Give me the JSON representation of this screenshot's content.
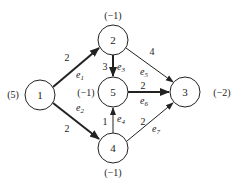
{
  "nodes": [
    {
      "id": "1",
      "label": "1",
      "supply": "(5)",
      "x": 40,
      "y": 95
    },
    {
      "id": "2",
      "label": "2",
      "supply": "(−1)",
      "x": 113,
      "y": 40
    },
    {
      "id": "5",
      "label": "5",
      "supply": "(−1)",
      "x": 113,
      "y": 92
    },
    {
      "id": "3",
      "label": "3",
      "supply": "(−2)",
      "x": 185,
      "y": 92
    },
    {
      "id": "4",
      "label": "4",
      "supply": "(−1)",
      "x": 113,
      "y": 148
    }
  ],
  "edges": [
    {
      "name": "e1",
      "from": "1",
      "to": "2",
      "weight": "2",
      "bold": true
    },
    {
      "name": "e2",
      "from": "1",
      "to": "4",
      "weight": "2",
      "bold": true
    },
    {
      "name": "e3",
      "from": "2",
      "to": "5",
      "weight": "3",
      "bold": true
    },
    {
      "name": "e4",
      "from": "4",
      "to": "5",
      "weight": "1",
      "bold": false
    },
    {
      "name": "e5",
      "from": "2",
      "to": "3",
      "weight": "4",
      "bold": false
    },
    {
      "name": "e6",
      "from": "5",
      "to": "3",
      "weight": "2",
      "bold": true
    },
    {
      "name": "e7",
      "from": "4",
      "to": "3",
      "weight": "2",
      "bold": false
    }
  ],
  "labels": {
    "n1": "1",
    "n2": "2",
    "n3": "3",
    "n4": "4",
    "n5": "5",
    "s1": "(5)",
    "s2": "(−1)",
    "s3": "(−2)",
    "s4": "(−1)",
    "s5": "(−1)",
    "w_e1": "2",
    "w_e2": "2",
    "w_e3": "3",
    "w_e4": "1",
    "w_e5": "4",
    "w_e6": "2",
    "w_e7": "2"
  }
}
